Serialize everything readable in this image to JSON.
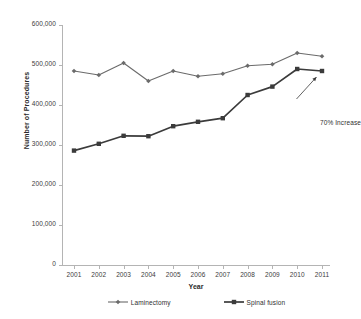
{
  "chart_data": {
    "type": "line",
    "title": "",
    "xlabel": "Year",
    "ylabel": "Number of Procedures",
    "categories": [
      "2001",
      "2002",
      "2003",
      "2004",
      "2005",
      "2006",
      "2007",
      "2008",
      "2009",
      "2010",
      "2011"
    ],
    "ylim": [
      0,
      600000
    ],
    "ytick_labels": [
      "600,000",
      "500,000",
      "400,000",
      "300,000",
      "200,000",
      "100,000",
      "0"
    ],
    "ytick_values": [
      600000,
      500000,
      400000,
      300000,
      200000,
      100000,
      0
    ],
    "grid": false,
    "legend_position": "bottom",
    "series": [
      {
        "name": "Laminectomy",
        "marker": "diamond",
        "color": "#6b6b6b",
        "values": [
          485000,
          475000,
          505000,
          460000,
          485000,
          472000,
          478000,
          498000,
          502000,
          530000,
          522000
        ]
      },
      {
        "name": "Spinal fusion",
        "marker": "square",
        "color": "#3b3b3b",
        "values": [
          286000,
          303000,
          323000,
          322000,
          347000,
          358000,
          367000,
          425000,
          446000,
          490000,
          485000
        ]
      }
    ],
    "annotations": [
      {
        "text": "70% Increase",
        "target_series": "Spinal fusion",
        "target_category": "2011",
        "arrow": "up-right"
      }
    ]
  },
  "legend": {
    "items": [
      {
        "label": "Laminectomy",
        "marker": "diamond",
        "color": "#6b6b6b"
      },
      {
        "label": "Spinal fusion",
        "marker": "square",
        "color": "#3b3b3b"
      }
    ]
  }
}
